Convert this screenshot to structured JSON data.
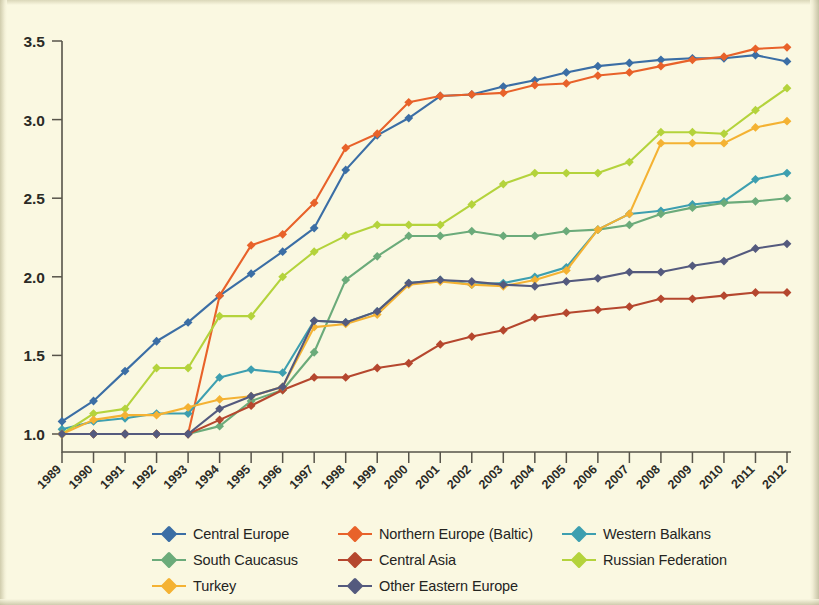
{
  "chart_data": {
    "type": "line",
    "title": "",
    "subtitle": "",
    "xlabel": "",
    "ylabel": "",
    "xlim": [
      1989,
      2012
    ],
    "ylim": [
      1.0,
      3.5
    ],
    "y_ticks": [
      "1.0",
      "1.5",
      "2.0",
      "2.5",
      "3.0",
      "3.5"
    ],
    "y_tick_values": [
      1.0,
      1.5,
      2.0,
      2.5,
      3.0,
      3.5
    ],
    "grid": false,
    "legend_position": "bottom",
    "marker": "diamond",
    "categories": [
      "1989",
      "1990",
      "1991",
      "1992",
      "1993",
      "1994",
      "1995",
      "1996",
      "1997",
      "1998",
      "1999",
      "2000",
      "2001",
      "2002",
      "2003",
      "2004",
      "2005",
      "2006",
      "2007",
      "2008",
      "2009",
      "2010",
      "2011",
      "2012"
    ],
    "series": [
      {
        "name": "Central Europe",
        "color": "#3b6ea5",
        "values": [
          1.08,
          1.21,
          1.4,
          1.59,
          1.71,
          1.88,
          2.02,
          2.16,
          2.31,
          2.68,
          2.9,
          3.01,
          3.15,
          3.16,
          3.21,
          3.25,
          3.3,
          3.34,
          3.36,
          3.38,
          3.39,
          3.39,
          3.41,
          3.37
        ]
      },
      {
        "name": "Northern Europe (Baltic)",
        "color": "#e8622a",
        "values": [
          1.0,
          1.0,
          1.0,
          1.0,
          1.0,
          1.88,
          2.2,
          2.27,
          2.47,
          2.82,
          2.91,
          3.11,
          3.15,
          3.16,
          3.17,
          3.22,
          3.23,
          3.28,
          3.3,
          3.34,
          3.38,
          3.4,
          3.45,
          3.46
        ]
      },
      {
        "name": "Western Balkans",
        "color": "#3d9fb0",
        "values": [
          1.03,
          1.08,
          1.1,
          1.13,
          1.13,
          1.36,
          1.41,
          1.39,
          1.72,
          1.71,
          1.78,
          1.96,
          1.98,
          1.95,
          1.96,
          2.0,
          2.06,
          2.3,
          2.4,
          2.42,
          2.46,
          2.48,
          2.62,
          2.66
        ]
      },
      {
        "name": "South Caucasus",
        "color": "#6bab7a",
        "values": [
          1.0,
          1.0,
          1.0,
          1.0,
          1.0,
          1.05,
          1.21,
          1.28,
          1.52,
          1.98,
          2.13,
          2.26,
          2.26,
          2.29,
          2.26,
          2.26,
          2.29,
          2.3,
          2.33,
          2.4,
          2.44,
          2.47,
          2.48,
          2.5
        ]
      },
      {
        "name": "Central Asia",
        "color": "#b5472e",
        "values": [
          1.0,
          1.0,
          1.0,
          1.0,
          1.0,
          1.09,
          1.18,
          1.28,
          1.36,
          1.36,
          1.42,
          1.45,
          1.57,
          1.62,
          1.66,
          1.74,
          1.77,
          1.79,
          1.81,
          1.86,
          1.86,
          1.88,
          1.9,
          1.9
        ]
      },
      {
        "name": "Russian Federation",
        "color": "#b4d33c",
        "values": [
          1.0,
          1.13,
          1.16,
          1.42,
          1.42,
          1.75,
          1.75,
          2.0,
          2.16,
          2.26,
          2.33,
          2.33,
          2.33,
          2.46,
          2.59,
          2.66,
          2.66,
          2.66,
          2.73,
          2.92,
          2.92,
          2.91,
          3.06,
          3.2
        ]
      },
      {
        "name": "Turkey",
        "color": "#f4b233",
        "values": [
          1.0,
          1.09,
          1.12,
          1.12,
          1.17,
          1.22,
          1.24,
          1.3,
          1.68,
          1.7,
          1.76,
          1.95,
          1.97,
          1.95,
          1.94,
          1.98,
          2.04,
          2.3,
          2.4,
          2.85,
          2.85,
          2.85,
          2.95,
          2.99
        ]
      },
      {
        "name": "Other Eastern Europe",
        "color": "#545a7e",
        "values": [
          1.0,
          1.0,
          1.0,
          1.0,
          1.0,
          1.16,
          1.24,
          1.3,
          1.72,
          1.71,
          1.78,
          1.96,
          1.98,
          1.97,
          1.95,
          1.94,
          1.97,
          1.99,
          2.03,
          2.03,
          2.07,
          2.1,
          2.18,
          2.21
        ]
      }
    ]
  },
  "legend": {
    "rows": [
      [
        {
          "label": "Central Europe",
          "color": "#3b6ea5",
          "name": "central-europe"
        },
        {
          "label": "Northern Europe (Baltic)",
          "color": "#e8622a",
          "name": "northern-europe-baltic"
        },
        {
          "label": "Western Balkans",
          "color": "#3d9fb0",
          "name": "western-balkans"
        }
      ],
      [
        {
          "label": "South Caucasus",
          "color": "#6bab7a",
          "name": "south-caucasus"
        },
        {
          "label": "Central Asia",
          "color": "#b5472e",
          "name": "central-asia"
        },
        {
          "label": "Russian Federation",
          "color": "#b4d33c",
          "name": "russian-federation"
        }
      ],
      [
        {
          "label": "Turkey",
          "color": "#f4b233",
          "name": "turkey"
        },
        {
          "label": "Other Eastern Europe",
          "color": "#545a7e",
          "name": "other-eastern-europe"
        }
      ]
    ]
  },
  "colors": {
    "background": "#faf8e1",
    "axis": "#57544a",
    "text": "#24241f"
  }
}
